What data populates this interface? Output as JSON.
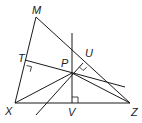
{
  "diagram": {
    "type": "triangle-geometry",
    "points": {
      "M": {
        "label": "M",
        "x": 36,
        "y": 17
      },
      "X": {
        "label": "X",
        "x": 15,
        "y": 103
      },
      "Z": {
        "label": "Z",
        "x": 130,
        "y": 103
      },
      "P": {
        "label": "P",
        "x": 72,
        "y": 73
      },
      "T": {
        "label": "T",
        "x": 25,
        "y": 60
      },
      "U": {
        "label": "U",
        "x": 83,
        "y": 63
      },
      "V": {
        "label": "V",
        "x": 72,
        "y": 103
      }
    },
    "labels": {
      "M": "M",
      "T": "T",
      "U": "U",
      "P": "P",
      "X": "X",
      "V": "V",
      "Z": "Z"
    },
    "right_angles": [
      "T",
      "U",
      "V"
    ],
    "stroke_color": "#1a1a1a",
    "background": "#ffffff"
  }
}
